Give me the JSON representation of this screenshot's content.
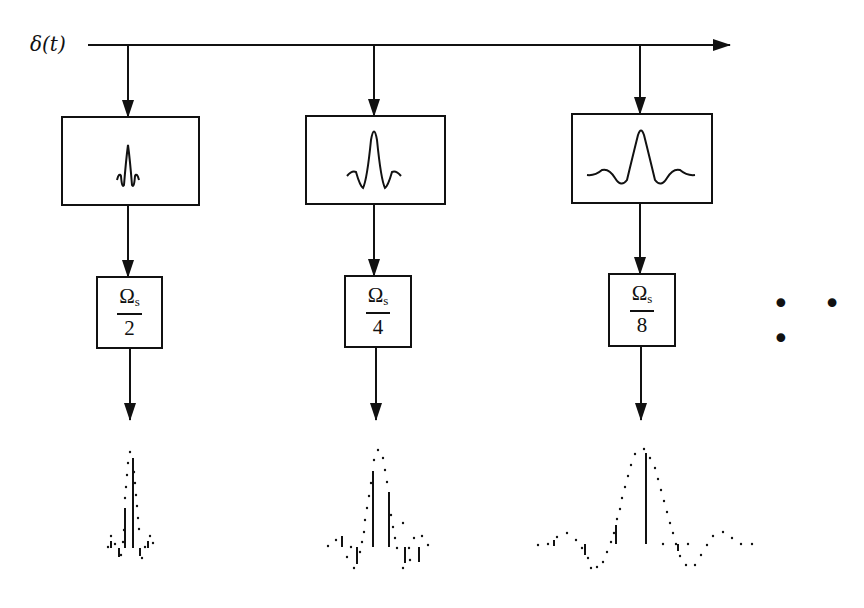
{
  "input": {
    "label": "δ(t)"
  },
  "colors": {
    "stroke": "#111111",
    "background": "#ffffff"
  },
  "stages": [
    {
      "filter_icon": "narrow-sinc-icon",
      "rate_numerator": "Ω",
      "rate_subscript": "s",
      "rate_denominator": "2"
    },
    {
      "filter_icon": "medium-sinc-icon",
      "rate_numerator": "Ω",
      "rate_subscript": "s",
      "rate_denominator": "4"
    },
    {
      "filter_icon": "wide-sinc-icon",
      "rate_numerator": "Ω",
      "rate_subscript": "s",
      "rate_denominator": "8"
    }
  ],
  "continuation": {
    "label": "• • •"
  }
}
